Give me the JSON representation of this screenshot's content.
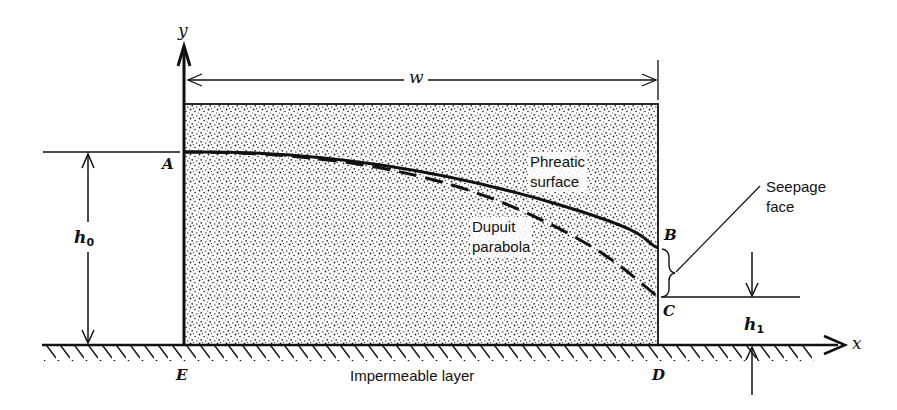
{
  "figure": {
    "colors": {
      "ink": "#111111",
      "background": "#ffffff",
      "stipple": "#222222"
    }
  },
  "axes": {
    "x_label": "x",
    "y_label": "y"
  },
  "points": {
    "A": "A",
    "B": "B",
    "C": "C",
    "D": "D",
    "E": "E"
  },
  "dimensions": {
    "width": "w",
    "h0_main": "h",
    "h0_sub": "0",
    "h1_main": "h",
    "h1_sub": "1"
  },
  "annotations": {
    "phreatic_line1": "Phreatic",
    "phreatic_line2": "surface",
    "dupuit_line1": "Dupuit",
    "dupuit_line2": "parabola",
    "seepage_line1": "Seepage",
    "seepage_line2": "face",
    "base_label": "Impermeable layer"
  },
  "curves": {
    "phreatic_surface": {
      "style": "solid",
      "from": "A",
      "to": "B"
    },
    "dupuit_parabola": {
      "style": "dashed",
      "from": "A",
      "to": "C"
    }
  }
}
